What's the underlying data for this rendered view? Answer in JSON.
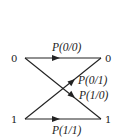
{
  "diagram": {
    "type": "binary-channel",
    "nodes": {
      "left_top": "0",
      "right_top": "0",
      "left_bottom": "1",
      "right_bottom": "1"
    },
    "edges": [
      {
        "from": "0",
        "to": "0",
        "label": "P(0/0)"
      },
      {
        "from": "1",
        "to": "0",
        "label": "P(0/1)"
      },
      {
        "from": "0",
        "to": "1",
        "label": "P(1/0)"
      },
      {
        "from": "1",
        "to": "1",
        "label": "P(1/1)"
      }
    ],
    "colors": {
      "line": "#222222",
      "background": "#ffffff"
    }
  }
}
